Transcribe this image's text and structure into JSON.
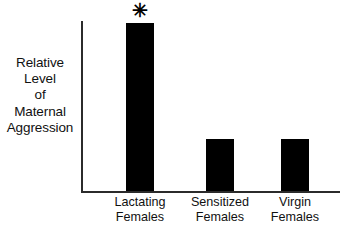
{
  "figure": {
    "background_color": "#ffffff",
    "axis_color": "#2b2b2b",
    "bar_color": "#000000",
    "text_color": "#111111"
  },
  "y_axis_label_lines": [
    "Relative",
    "Level",
    "of",
    "Maternal",
    "Aggression"
  ],
  "significance": {
    "marker": "✳",
    "applies_to": "Lactating Females"
  },
  "categories": [
    {
      "line1": "Lactating",
      "line2": "Females"
    },
    {
      "line1": "Sensitized",
      "line2": "Females"
    },
    {
      "line1": "Virgin",
      "line2": "Females"
    }
  ],
  "chart_data": {
    "type": "bar",
    "title": "",
    "subtitle": "",
    "xlabel": "",
    "ylabel": "Relative Level of Maternal Aggression",
    "categories": [
      "Lactating Females",
      "Sensitized Females",
      "Virgin Females"
    ],
    "values": [
      98,
      30,
      30
    ],
    "ylim": [
      0,
      100
    ],
    "y_tick_labels": [],
    "x_tick_labels": [
      "Lactating Females",
      "Sensitized Females",
      "Virgin Females"
    ],
    "grid": false,
    "legend": false,
    "legend_position": "none",
    "bar_color": "#000000",
    "annotations": [
      {
        "text": "✳",
        "category": "Lactating Females",
        "meaning": "statistically significant difference",
        "position": "above-bar"
      }
    ],
    "series": [
      {
        "name": "Relative Level of Maternal Aggression",
        "values": [
          98,
          30,
          30
        ]
      }
    ]
  },
  "geometry": {
    "bar_width_px": 28,
    "plot_height_px": 170,
    "bar_heights_px": [
      168,
      52,
      52
    ]
  }
}
